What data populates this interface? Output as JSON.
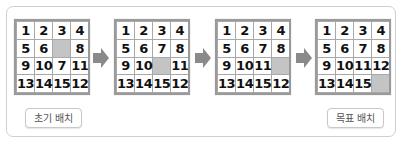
{
  "puzzles": [
    {
      "name": "initial",
      "cells": [
        "1",
        "2",
        "3",
        "4",
        "5",
        "6",
        "",
        "8",
        "9",
        "10",
        "7",
        "11",
        "13",
        "14",
        "15",
        "12"
      ]
    },
    {
      "name": "step-2",
      "cells": [
        "1",
        "2",
        "3",
        "4",
        "5",
        "6",
        "7",
        "8",
        "9",
        "10",
        "",
        "11",
        "13",
        "14",
        "15",
        "12"
      ]
    },
    {
      "name": "step-3",
      "cells": [
        "1",
        "2",
        "3",
        "4",
        "5",
        "6",
        "7",
        "8",
        "9",
        "10",
        "11",
        "",
        "13",
        "14",
        "15",
        "12"
      ]
    },
    {
      "name": "goal",
      "cells": [
        "1",
        "2",
        "3",
        "4",
        "5",
        "6",
        "7",
        "8",
        "9",
        "10",
        "11",
        "12",
        "13",
        "14",
        "15",
        ""
      ]
    }
  ],
  "arrow_icon": "right-arrow-icon",
  "labels": {
    "initial": "초기 배치",
    "goal": "목표 배치"
  },
  "colors": {
    "blank_cell": "#c4c4c4",
    "arrow": "#8a8a8a",
    "grid_border": "#9a9a9a"
  }
}
